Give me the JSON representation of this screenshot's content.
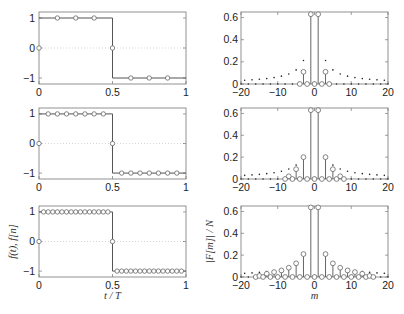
{
  "chart_data": [
    {
      "type": "line",
      "panel": "top-left",
      "title": "",
      "xlabel": "",
      "ylabel": "",
      "xlim": [
        0,
        1
      ],
      "ylim": [
        -1.2,
        1.2
      ],
      "xticks": [
        "0",
        "0.5",
        "1"
      ],
      "yticks": [
        "-1",
        "0",
        "1"
      ],
      "grid": "dotted y=0",
      "series": [
        {
          "name": "f(t)",
          "style": "solid step",
          "x": [
            0,
            0.5,
            0.5,
            1
          ],
          "y": [
            1,
            1,
            -1,
            -1
          ]
        },
        {
          "name": "f[n]",
          "style": "circles",
          "N": 8,
          "x": [
            0,
            0.125,
            0.25,
            0.375,
            0.5,
            0.625,
            0.75,
            0.875
          ],
          "y": [
            0,
            1,
            1,
            1,
            0,
            -1,
            -1,
            -1
          ]
        }
      ]
    },
    {
      "type": "scatter",
      "panel": "top-right",
      "xlabel": "",
      "ylabel": "",
      "xlim": [
        -20,
        20
      ],
      "ylim": [
        0,
        0.65
      ],
      "xticks": [
        "-20",
        "-10",
        "0",
        "10",
        "20"
      ],
      "yticks": [
        "0",
        "0.2",
        "0.4",
        "0.6"
      ],
      "series": [
        {
          "name": "|F[m]|/N (DFT, N=8)",
          "style": "stems with circles",
          "x": [
            -4,
            -3,
            -2,
            -1,
            0,
            1,
            2,
            3,
            4
          ],
          "y": [
            0,
            0.11,
            0,
            0.63,
            0,
            0.63,
            0,
            0.11,
            0
          ]
        },
        {
          "name": "|c_m| continuous",
          "style": "dots",
          "formula": "2/(pi|m|) for odd m, 0 for even m"
        }
      ]
    },
    {
      "type": "line",
      "panel": "middle-left",
      "xlim": [
        0,
        1
      ],
      "ylim": [
        -1.2,
        1.2
      ],
      "xticks": [
        "0",
        "0.5",
        "1"
      ],
      "yticks": [
        "-1",
        "0",
        "1"
      ],
      "series": [
        {
          "name": "f(t)",
          "style": "solid step",
          "x": [
            0,
            0.5,
            0.5,
            1
          ],
          "y": [
            1,
            1,
            -1,
            -1
          ]
        },
        {
          "name": "f[n]",
          "style": "circles",
          "N": 16,
          "x": [
            0,
            0.0625,
            0.125,
            0.1875,
            0.25,
            0.3125,
            0.375,
            0.4375,
            0.5,
            0.5625,
            0.625,
            0.6875,
            0.75,
            0.8125,
            0.875,
            0.9375
          ],
          "y": [
            0,
            1,
            1,
            1,
            1,
            1,
            1,
            1,
            0,
            -1,
            -1,
            -1,
            -1,
            -1,
            -1,
            -1
          ]
        }
      ]
    },
    {
      "type": "scatter",
      "panel": "middle-right",
      "xlim": [
        -20,
        20
      ],
      "ylim": [
        0,
        0.65
      ],
      "xticks": [
        "-20",
        "-10",
        "0",
        "10",
        "20"
      ],
      "yticks": [
        "0",
        "0.2",
        "0.4",
        "0.6"
      ],
      "series": [
        {
          "name": "|F[m]|/N (DFT, N=16)",
          "style": "stems with circles",
          "x": [
            -8,
            -7,
            -6,
            -5,
            -4,
            -3,
            -2,
            -1,
            0,
            1,
            2,
            3,
            4,
            5,
            6,
            7,
            8
          ],
          "y": [
            0,
            0.025,
            0,
            0.09,
            0,
            0.2,
            0,
            0.63,
            0,
            0.63,
            0,
            0.2,
            0,
            0.09,
            0,
            0.025,
            0
          ]
        },
        {
          "name": "|c_m| continuous",
          "style": "dots",
          "formula": "2/(pi|m|) for odd m, 0 for even m"
        }
      ]
    },
    {
      "type": "line",
      "panel": "bottom-left",
      "xlabel": "t/T",
      "ylabel": "f(t), f[n]",
      "xlim": [
        0,
        1
      ],
      "ylim": [
        -1.2,
        1.2
      ],
      "xticks": [
        "0",
        "0.5",
        "1"
      ],
      "yticks": [
        "-1",
        "0",
        "1"
      ],
      "series": [
        {
          "name": "f(t)",
          "style": "solid step",
          "x": [
            0,
            0.5,
            0.5,
            1
          ],
          "y": [
            1,
            1,
            -1,
            -1
          ]
        },
        {
          "name": "f[n]",
          "style": "circles",
          "N": 32,
          "rule": "n=0 and n=16 are 0; 1..15 are 1; 17..31 are -1"
        }
      ]
    },
    {
      "type": "scatter",
      "panel": "bottom-right",
      "xlabel": "m",
      "ylabel": "|F[m]|/N",
      "xlim": [
        -20,
        20
      ],
      "ylim": [
        0,
        0.65
      ],
      "xticks": [
        "-20",
        "-10",
        "0",
        "10",
        "20"
      ],
      "yticks": [
        "0",
        "0.2",
        "0.4",
        "0.6"
      ],
      "series": [
        {
          "name": "|F[m]|/N (DFT, N=32)",
          "style": "stems with circles",
          "x": [
            -16,
            -15,
            -13,
            -11,
            -9,
            -7,
            -5,
            -3,
            -1,
            0,
            1,
            3,
            5,
            7,
            9,
            11,
            13,
            15,
            16
          ],
          "y": [
            0,
            0.01,
            0.03,
            0.045,
            0.06,
            0.085,
            0.125,
            0.21,
            0.637,
            0,
            0.637,
            0.21,
            0.125,
            0.085,
            0.06,
            0.045,
            0.03,
            0.01,
            0
          ]
        },
        {
          "name": "|c_m| continuous",
          "style": "dots",
          "formula": "2/(pi|m|) for odd m, 0 for even m"
        }
      ]
    }
  ],
  "labels": {
    "left_xlabel": "t / T",
    "left_ylabel": "f(t), f[n]",
    "right_xlabel": "m",
    "right_ylabel": "|F[m]| / N"
  },
  "ticks": {
    "left_x": [
      "0",
      "0.5",
      "1"
    ],
    "left_y": [
      "1",
      "0",
      "−1"
    ],
    "right_x": [
      "−20",
      "−10",
      "0",
      "10",
      "20"
    ],
    "right_y": [
      "0.6",
      "0.4",
      "0.2",
      "0"
    ]
  },
  "N_values": [
    8,
    16,
    32
  ],
  "colors": {
    "line": "#555555",
    "marker": "#666666",
    "dot": "#222222",
    "grid": "#bbbbbb"
  }
}
